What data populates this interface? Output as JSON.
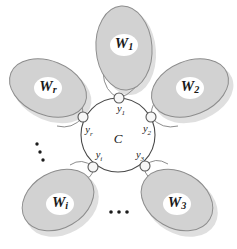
{
  "figure": {
    "type": "graph-diagram",
    "background_color": "#ffffff",
    "lobe_fill_color": "#d2d2d2",
    "lobe_stroke_color": "#8d8d8d",
    "core_stroke_color": "#4a4a4a",
    "vertex_fill_color": "#f7f7f7",
    "label_color": "#1a1a1a"
  },
  "core": {
    "label": "C",
    "cx": 118,
    "cy": 135,
    "r": 37
  },
  "lobes": [
    {
      "id": "W1",
      "base": "W",
      "sub": "1",
      "label_x": 124,
      "label_y": 45,
      "cx": 124,
      "cy": 48,
      "rx": 28,
      "ry": 42,
      "rotation": -4,
      "vertex": "y1"
    },
    {
      "id": "W2",
      "base": "W",
      "sub": "2",
      "label_x": 190,
      "label_y": 88,
      "cx": 190,
      "cy": 88,
      "rx": 40,
      "ry": 27,
      "rotation": -22,
      "vertex": "y2"
    },
    {
      "id": "W3",
      "base": "W",
      "sub": "3",
      "label_x": 177,
      "label_y": 204,
      "cx": 177,
      "cy": 200,
      "rx": 38,
      "ry": 28,
      "rotation": 30,
      "vertex": "y3"
    },
    {
      "id": "Wi",
      "base": "W",
      "sub": "i",
      "label_x": 60,
      "label_y": 204,
      "cx": 58,
      "cy": 200,
      "rx": 38,
      "ry": 28,
      "rotation": -30,
      "vertex": "yi"
    },
    {
      "id": "Wr",
      "base": "W",
      "sub": "r",
      "label_x": 48,
      "label_y": 88,
      "cx": 48,
      "cy": 88,
      "rx": 40,
      "ry": 27,
      "rotation": 22,
      "vertex": "yr"
    }
  ],
  "vertices": [
    {
      "id": "y1",
      "base": "y",
      "sub": "1",
      "x": 119,
      "y": 98,
      "label_x": 121,
      "label_y": 110
    },
    {
      "id": "y2",
      "base": "y",
      "sub": "2",
      "x": 151,
      "y": 117,
      "label_x": 147,
      "label_y": 130
    },
    {
      "id": "y3",
      "base": "y",
      "sub": "3",
      "x": 145,
      "y": 166,
      "label_x": 140,
      "label_y": 156
    },
    {
      "id": "yi",
      "base": "y",
      "sub": "i",
      "x": 93,
      "y": 167,
      "label_x": 99,
      "label_y": 156
    },
    {
      "id": "yr",
      "base": "y",
      "sub": "r",
      "x": 83,
      "y": 117,
      "label_x": 89,
      "label_y": 131
    }
  ],
  "ellipses_marks": [
    {
      "id": "vertical-ellipsis",
      "orientation": "vertical",
      "dots": [
        {
          "cx": 37,
          "cy": 144
        },
        {
          "cx": 40,
          "cy": 152
        },
        {
          "cx": 43,
          "cy": 160
        }
      ]
    },
    {
      "id": "horizontal-ellipsis",
      "orientation": "horizontal",
      "dots": [
        {
          "cx": 111,
          "cy": 212
        },
        {
          "cx": 119,
          "cy": 212
        },
        {
          "cx": 127,
          "cy": 212
        }
      ]
    }
  ]
}
